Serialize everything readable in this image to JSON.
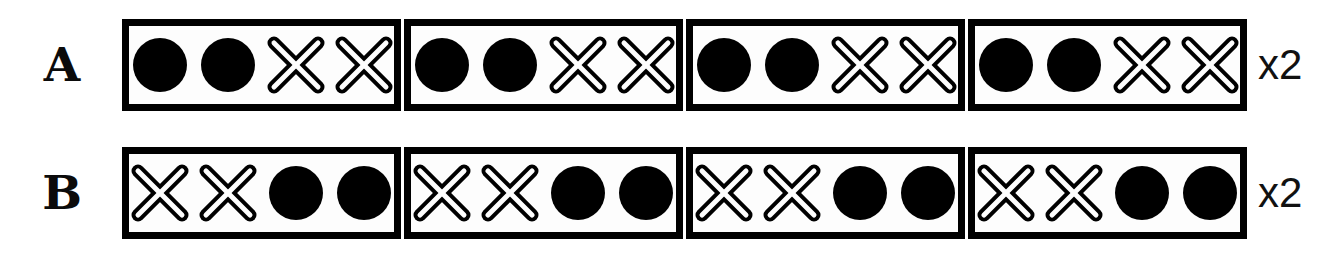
{
  "diagram": {
    "symbol_glyphs": {
      "circle": "filled-circle",
      "cross": "outlined-x"
    },
    "colors": {
      "ink": "#000000",
      "background": "#ffffff",
      "cell_fill": "#fdfdfd"
    },
    "rows": [
      {
        "label": "A",
        "multiplier": "x2",
        "pattern": [
          "circle",
          "circle",
          "cross",
          "cross"
        ],
        "cells": [
          {
            "symbols": [
              "circle",
              "circle",
              "cross",
              "cross"
            ]
          },
          {
            "symbols": [
              "circle",
              "circle",
              "cross",
              "cross"
            ]
          },
          {
            "symbols": [
              "circle",
              "circle",
              "cross",
              "cross"
            ]
          },
          {
            "symbols": [
              "circle",
              "circle",
              "cross",
              "cross"
            ]
          }
        ]
      },
      {
        "label": "B",
        "multiplier": "x2",
        "pattern": [
          "cross",
          "cross",
          "circle",
          "circle"
        ],
        "cells": [
          {
            "symbols": [
              "cross",
              "cross",
              "circle",
              "circle"
            ]
          },
          {
            "symbols": [
              "cross",
              "cross",
              "circle",
              "circle"
            ]
          },
          {
            "symbols": [
              "cross",
              "cross",
              "circle",
              "circle"
            ]
          },
          {
            "symbols": [
              "cross",
              "cross",
              "circle",
              "circle"
            ]
          }
        ]
      }
    ]
  }
}
